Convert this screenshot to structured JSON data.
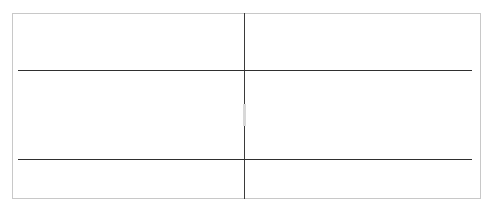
{
  "colors": {
    "highlight": "#e8571f",
    "line": "#333333",
    "marker_text": "#d9b48a",
    "marker_dot": "#e06a4a"
  },
  "chart_upper": {
    "left_labels": [
      "7",
      "6",
      "5",
      "4",
      "3",
      "2",
      "1"
    ],
    "right_labels": [
      "1",
      "2",
      "3",
      "4",
      "5",
      "6",
      "7"
    ]
  },
  "chart_lower_labels": {
    "left_labels": [
      "7",
      "6",
      "5",
      "4",
      "3",
      "2",
      "1"
    ],
    "right_labels": [
      "1",
      "2",
      "3",
      "4",
      "5",
      "6",
      "7"
    ]
  },
  "markers": [
    {
      "x": 37,
      "y": 45,
      "t": "4"
    },
    {
      "x": 51,
      "y": 45,
      "t": "4"
    },
    {
      "x": 37,
      "y": 58,
      "t": "5"
    },
    {
      "x": 51,
      "y": 58,
      "t": "5"
    },
    {
      "x": 51,
      "y": 81,
      "t": "6"
    },
    {
      "x": 19,
      "y": 94,
      "t": "4"
    },
    {
      "x": 51,
      "y": 94,
      "t": "7"
    },
    {
      "x": 304,
      "y": 45,
      "t": "4"
    },
    {
      "x": 318,
      "y": 45,
      "t": "4"
    },
    {
      "x": 435,
      "y": 43,
      "t": "5"
    },
    {
      "x": 449,
      "y": 43,
      "t": "5"
    },
    {
      "x": 467,
      "y": 43,
      "t": "5"
    },
    {
      "x": 436,
      "y": 58,
      "t": "5"
    },
    {
      "x": 449,
      "y": 58,
      "t": "5"
    },
    {
      "x": 449,
      "y": 81,
      "t": "4"
    },
    {
      "x": 467,
      "y": 81,
      "t": "4"
    }
  ],
  "dots": [
    {
      "x": 101,
      "y": 51
    },
    {
      "x": 134,
      "y": 56
    },
    {
      "x": 23,
      "y": 88
    },
    {
      "x": 29,
      "y": 85
    },
    {
      "x": 35,
      "y": 89
    },
    {
      "x": 101,
      "y": 93
    },
    {
      "x": 356,
      "y": 87
    },
    {
      "x": 434,
      "y": 50
    },
    {
      "x": 436,
      "y": 55
    },
    {
      "x": 454,
      "y": 50
    },
    {
      "x": 454,
      "y": 55
    }
  ],
  "teeth_rows": [
    {
      "row": "upper",
      "left": [
        {
          "num": "7",
          "value": "0",
          "facet": "right"
        },
        {
          "num": "6",
          "value": "0",
          "facet": "left"
        },
        {
          "num": "5",
          "value": "0",
          "facet": "none"
        },
        {
          "num": "4",
          "value": "0",
          "facet": "left"
        },
        {
          "num": "3",
          "value": "0",
          "facet": "none"
        },
        {
          "num": "2",
          "value": "0",
          "facet": "none"
        },
        {
          "num": "1",
          "value": "0",
          "facet": "none"
        }
      ],
      "right": [
        {
          "num": "1",
          "value": "0",
          "facet": "none"
        },
        {
          "num": "2",
          "value": "0",
          "facet": "right"
        },
        {
          "num": "3",
          "value": "0",
          "facet": "none"
        },
        {
          "num": "4",
          "value": "0",
          "facet": "none"
        },
        {
          "num": "5",
          "value": "0",
          "facet": "none"
        },
        {
          "num": "6",
          "value": "0",
          "facet": "right"
        },
        {
          "num": "7",
          "value": "0",
          "facet": "left"
        }
      ]
    },
    {
      "row": "lower",
      "left": [
        {
          "num": "7",
          "value": "0",
          "facet": "right"
        },
        {
          "num": "6",
          "value": "0",
          "facet": "left"
        },
        {
          "num": "5",
          "value": "0",
          "facet": "none"
        },
        {
          "num": "4",
          "value": "0",
          "facet": "none"
        },
        {
          "num": "3",
          "value": "0",
          "facet": "none"
        },
        {
          "num": "2",
          "value": "0",
          "facet": "none"
        },
        {
          "num": "1",
          "value": "0",
          "facet": "none"
        }
      ],
      "right": [
        {
          "num": "1",
          "value": "0",
          "facet": "none"
        },
        {
          "num": "2",
          "value": "0",
          "facet": "none"
        },
        {
          "num": "3",
          "value": "0",
          "facet": "none"
        },
        {
          "num": "4",
          "value": "0",
          "facet": "none"
        },
        {
          "num": "5",
          "value": "0",
          "facet": "none"
        },
        {
          "num": "6",
          "value": "0",
          "facet": "none"
        },
        {
          "num": "7",
          "value": "0",
          "facet": "none"
        }
      ]
    }
  ]
}
